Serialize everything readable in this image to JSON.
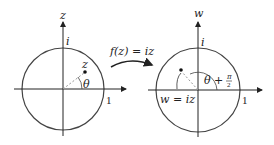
{
  "diagram": {
    "left_plane": {
      "axis_label": "z",
      "imag_unit_label": "i",
      "point_label": "z",
      "angle_label": "θ",
      "real_unit_label": "1"
    },
    "mapping": {
      "label": "f(z) = iz"
    },
    "right_plane": {
      "axis_label": "w",
      "imag_unit_label": "i",
      "angle_label": "θ + π/2",
      "angle_main": "θ +",
      "angle_frac_num": "π",
      "angle_frac_den": "2",
      "point_label": "w = iz",
      "real_unit_label": "1"
    },
    "colors": {
      "circle": "#444444",
      "axes": "#222222",
      "dashed": "#999999"
    }
  }
}
